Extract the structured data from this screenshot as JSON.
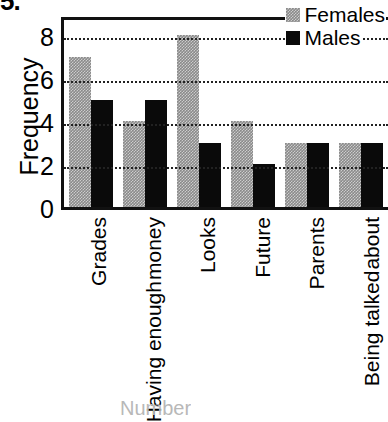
{
  "figure": {
    "caption_stub": "5.",
    "xaxis_title_stub": "Number"
  },
  "legend": {
    "position": "top-right-inside",
    "entries": [
      {
        "label": "Females",
        "swatch": "gray-square-icon",
        "color": "#8a8a8a"
      },
      {
        "label": "Males",
        "swatch": "black-square-icon",
        "color": "#0a0a0a"
      }
    ]
  },
  "axes": {
    "ylabel": "Frequency",
    "yticks": [
      "0",
      "2",
      "4",
      "6",
      "8"
    ]
  },
  "chart_data": {
    "type": "bar",
    "title": "",
    "xlabel": "",
    "ylabel": "Frequency",
    "ylim": [
      0,
      9
    ],
    "yticks": [
      0,
      2,
      4,
      6,
      8
    ],
    "grid": true,
    "grid_axis": "y",
    "grid_style": "dotted",
    "legend_position": "upper right",
    "categories": [
      "Grades",
      "Having enough money",
      "Looks",
      "Future",
      "Parents",
      "Being talked about"
    ],
    "category_lines": [
      [
        "Grades"
      ],
      [
        "Having enough",
        "money"
      ],
      [
        "Looks"
      ],
      [
        "Future"
      ],
      [
        "Parents"
      ],
      [
        "Being talked",
        "about"
      ]
    ],
    "series": [
      {
        "name": "Females",
        "color": "#8a8a8a",
        "values": [
          7,
          4,
          8,
          4,
          3,
          3
        ]
      },
      {
        "name": "Males",
        "color": "#0a0a0a",
        "values": [
          5,
          5,
          3,
          2,
          3,
          3
        ]
      }
    ]
  }
}
